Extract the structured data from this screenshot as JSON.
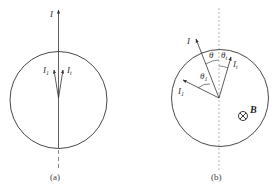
{
  "figure_a": {
    "caption": "(a)",
    "labels": {
      "incident": "I",
      "reflected_main": "I",
      "reflected_sub": "1",
      "transmitted_main": "I",
      "transmitted_sub": "t"
    }
  },
  "figure_b": {
    "caption": "(b)",
    "labels": {
      "incident": "I",
      "angle_incident": "θ",
      "angle_t_main": "θ",
      "angle_t_sub": "t",
      "angle_1_main": "θ",
      "angle_1_sub": "1",
      "reflected_main": "I",
      "reflected_sub": "1",
      "transmitted_main": "I",
      "transmitted_sub": "t",
      "field": "B",
      "field_symbol": "⊗"
    }
  },
  "colors": {
    "stroke": "#333333",
    "dashed": "#888888"
  }
}
